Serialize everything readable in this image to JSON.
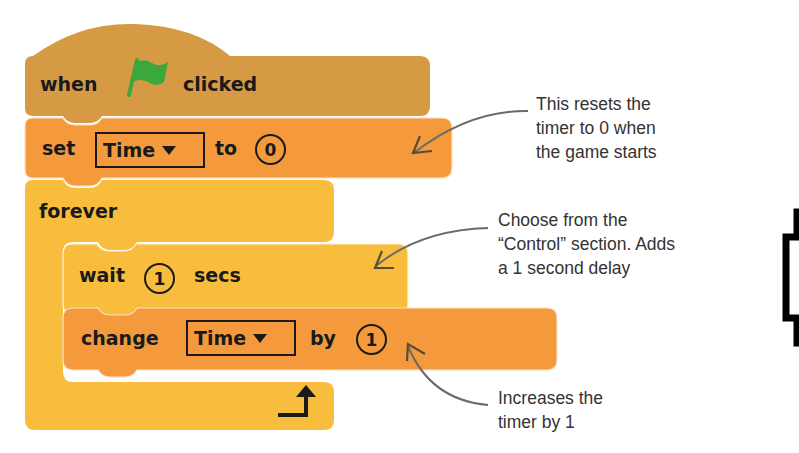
{
  "colors": {
    "events_block": "#d69a45",
    "data_block": "#f49a3c",
    "control_block": "#f8bd3c",
    "flag_green": "#3aa83a",
    "text": "#1a1a1a",
    "annotation_text": "#333333",
    "arrow": "#6a6a6a"
  },
  "script": {
    "hat_block": {
      "word1": "when",
      "icon": "green-flag-icon",
      "word2": "clicked"
    },
    "set_block": {
      "word1": "set",
      "variable": "Time",
      "word2": "to",
      "value": "0"
    },
    "forever_block": {
      "label": "forever",
      "end_icon": "loop-arrow-icon"
    },
    "wait_block": {
      "word1": "wait",
      "value": "1",
      "word2": "secs"
    },
    "change_block": {
      "word1": "change",
      "variable": "Time",
      "word2": "by",
      "value": "1"
    }
  },
  "annotations": {
    "reset": {
      "lines": [
        "This resets the",
        "timer to 0 when",
        "the game starts"
      ]
    },
    "control": {
      "lines": [
        "Choose from the",
        "“Control” section. Adds",
        "a 1 second delay"
      ]
    },
    "increase": {
      "lines": [
        "Increases the",
        "timer by 1"
      ]
    }
  }
}
